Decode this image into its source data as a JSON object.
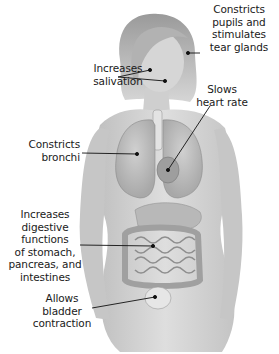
{
  "diagram": {
    "figure": "female-anatomical-body",
    "colors": {
      "background": "#ffffff",
      "skin": "#cfcfcf",
      "organ": "#bdbdbd",
      "label_text": "#1a1a1a",
      "leader_line": "#111111"
    },
    "labels": [
      {
        "id": "eyes",
        "text": "Constricts\npupils and\nstimulates\ntear glands",
        "target": "eye"
      },
      {
        "id": "salivary",
        "text": "Increases\nsalivation",
        "target": "salivary-glands"
      },
      {
        "id": "heart",
        "text": "Slows\nheart rate",
        "target": "heart"
      },
      {
        "id": "lungs",
        "text": "Constricts\nbronchi",
        "target": "lungs"
      },
      {
        "id": "digestive",
        "text": "Increases\ndigestive\nfunctions\nof stomach,\npancreas, and\nintestines",
        "target": "intestines"
      },
      {
        "id": "bladder",
        "text": "Allows\nbladder\ncontraction",
        "target": "bladder"
      }
    ]
  }
}
